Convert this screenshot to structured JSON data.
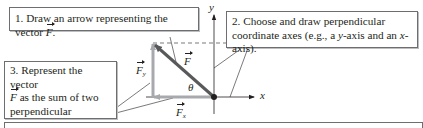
{
  "steps": [
    {
      "number": "1.",
      "text": "Draw an arrow representing the vector",
      "vector": "F",
      "end": "."
    },
    {
      "number": "2.",
      "line1": "Choose and draw perpendicular",
      "line2_a": "coordinate axes (e.g., a ",
      "line2_y": "y",
      "line2_b": "-axis and an ",
      "line2_x": "x",
      "line2_c": "-axis)."
    },
    {
      "number": "3.",
      "line1": "Represent the vector",
      "line2_vec": "F",
      "line2_rest": " as the sum of two",
      "line3": "perpendicular component",
      "line4_a": "vectors ",
      "line4_v1": "F",
      "line4_s1": "y",
      "line4_and": " and ",
      "line4_v2": "F",
      "line4_s2": "x",
      "line4_end": "."
    }
  ],
  "labels": {
    "y_axis": "y",
    "x_axis": "x",
    "vector": "F",
    "fy_base": "F",
    "fy_sub": "y",
    "fx_base": "F",
    "fx_sub": "x",
    "angle": "θ"
  },
  "colors": {
    "vector": "#58595b",
    "component": "#a7a9ac",
    "axis": "#231f20",
    "box_border": "#6d6e71"
  }
}
